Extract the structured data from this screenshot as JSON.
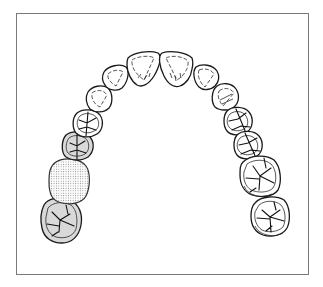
{
  "diagram": {
    "title": "Maxillary dental arch (occlusal view)",
    "view": "occlusal",
    "frame_color": "#7a7a7a",
    "colors": {
      "outline": "#1a1a1a",
      "abutment_shade": "#d9d9d9",
      "pontic_stipple": "#9a9a9a",
      "background": "#ffffff"
    },
    "teeth": [
      {
        "id": "left-second-molar",
        "type": "molar",
        "state": "abutment-shaded"
      },
      {
        "id": "left-first-molar",
        "type": "molar",
        "state": "pontic-stippled"
      },
      {
        "id": "left-second-premolar",
        "type": "premolar",
        "state": "abutment-shaded"
      },
      {
        "id": "left-first-premolar",
        "type": "premolar",
        "state": "normal"
      },
      {
        "id": "left-canine",
        "type": "canine",
        "state": "normal"
      },
      {
        "id": "left-lateral-incisor",
        "type": "incisor",
        "state": "normal"
      },
      {
        "id": "left-central-incisor",
        "type": "incisor",
        "state": "normal"
      },
      {
        "id": "right-central-incisor",
        "type": "incisor",
        "state": "normal"
      },
      {
        "id": "right-lateral-incisor",
        "type": "incisor",
        "state": "normal"
      },
      {
        "id": "right-canine",
        "type": "canine",
        "state": "normal"
      },
      {
        "id": "right-first-premolar",
        "type": "premolar",
        "state": "normal"
      },
      {
        "id": "right-second-premolar",
        "type": "premolar",
        "state": "normal"
      },
      {
        "id": "right-first-molar",
        "type": "molar",
        "state": "normal"
      },
      {
        "id": "right-second-molar",
        "type": "molar",
        "state": "normal"
      }
    ]
  }
}
